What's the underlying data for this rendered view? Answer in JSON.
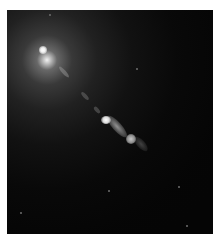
{
  "image": {
    "subject": "galaxy with bright core and relativistic jet",
    "colors": {
      "background": "#ffffff",
      "sky": "#050505",
      "core": "#ffffff",
      "jet": "#c8c8c8"
    },
    "frame": {
      "x": 7,
      "y": 10,
      "width": 206,
      "height": 224
    },
    "features": {
      "core_position": [
        43,
        50
      ],
      "jet_direction": "down-right",
      "bright_knot_position": [
        104,
        117
      ],
      "secondary_knot_position": [
        131,
        135
      ]
    },
    "stars": [
      [
        49,
        14
      ],
      [
        136,
        68
      ],
      [
        178,
        186
      ],
      [
        20,
        212
      ],
      [
        186,
        225
      ],
      [
        108,
        190
      ]
    ]
  }
}
